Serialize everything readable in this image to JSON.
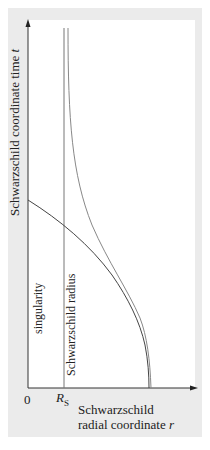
{
  "figure": {
    "y_axis": {
      "label": "Schwarzschild coordinate time",
      "symbol": "t"
    },
    "x_axis": {
      "label_line1": "Schwarzschild",
      "label_line2": "radial coordinate",
      "symbol": "r"
    },
    "ticks": {
      "origin": "0",
      "rs_main": "R",
      "rs_sub": "S"
    },
    "annotations": {
      "singularity": "singularity",
      "schwarzschild_radius": "Schwarzschild radius"
    },
    "colors": {
      "panel_background": "#ebebeb",
      "plot_background": "#ffffff",
      "axis": "#333333",
      "curve_dark": "#444444",
      "curve_light": "#888888"
    }
  }
}
